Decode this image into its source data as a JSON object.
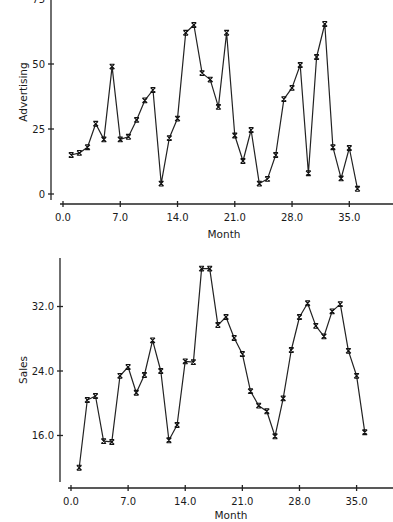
{
  "chart_data": [
    {
      "type": "line",
      "title": "",
      "xlabel": "Month",
      "ylabel": "Advertising",
      "x_ticks": [
        0.0,
        7.0,
        14.0,
        21.0,
        28.0,
        35.0
      ],
      "x_tick_labels": [
        "0.0",
        "7.0",
        "14.0",
        "21.0",
        "28.0",
        "35.0"
      ],
      "y_ticks": [
        0,
        25,
        50,
        75
      ],
      "y_tick_labels": [
        "0",
        "25",
        "50",
        "75"
      ],
      "xlim": [
        0,
        40
      ],
      "ylim": [
        0,
        75
      ],
      "grid": false,
      "marker": "x",
      "x": [
        1,
        2,
        3,
        4,
        5,
        6,
        7,
        8,
        9,
        10,
        11,
        12,
        13,
        14,
        15,
        16,
        17,
        18,
        19,
        20,
        21,
        22,
        23,
        24,
        25,
        26,
        27,
        28,
        29,
        30,
        31,
        32,
        33,
        34,
        35,
        36
      ],
      "values": [
        15,
        15.8,
        18,
        27,
        21,
        49,
        21,
        22,
        28.5,
        36,
        40,
        4,
        21.5,
        29,
        62,
        65,
        46.5,
        44,
        33.5,
        62,
        22.5,
        12.7,
        24.6,
        4,
        5.8,
        15,
        36.5,
        40.8,
        49.6,
        8,
        52.7,
        65.4,
        18,
        6,
        17.7,
        2
      ]
    },
    {
      "type": "line",
      "title": "",
      "xlabel": "Month",
      "ylabel": "Sales",
      "x_ticks": [
        0.0,
        7.0,
        14.0,
        21.0,
        28.0,
        35.0
      ],
      "x_tick_labels": [
        "0.0",
        "7.0",
        "14.0",
        "21.0",
        "28.0",
        "35.0"
      ],
      "y_ticks": [
        16.0,
        24.0,
        32.0
      ],
      "y_tick_labels": [
        "16.0",
        "24.0",
        "32.0"
      ],
      "xlim": [
        0,
        40
      ],
      "ylim": [
        9,
        38
      ],
      "grid": false,
      "marker": "x",
      "x": [
        1,
        2,
        3,
        4,
        5,
        6,
        7,
        8,
        9,
        10,
        11,
        12,
        13,
        14,
        15,
        16,
        17,
        18,
        19,
        20,
        21,
        22,
        23,
        24,
        25,
        26,
        27,
        28,
        29,
        30,
        31,
        32,
        33,
        34,
        35,
        36
      ],
      "values": [
        12.0,
        20.4,
        20.9,
        15.3,
        15.2,
        23.4,
        24.5,
        21.3,
        23.5,
        27.8,
        24.0,
        15.4,
        17.3,
        25.2,
        25.1,
        36.7,
        36.7,
        29.7,
        30.7,
        28.1,
        26.1,
        21.5,
        19.7,
        19.0,
        15.9,
        20.6,
        26.6,
        30.7,
        32.4,
        29.6,
        28.3,
        31.4,
        32.3,
        26.5,
        23.4,
        16.4
      ]
    }
  ],
  "colors": {
    "line": "#222222",
    "background": "#ffffff"
  }
}
